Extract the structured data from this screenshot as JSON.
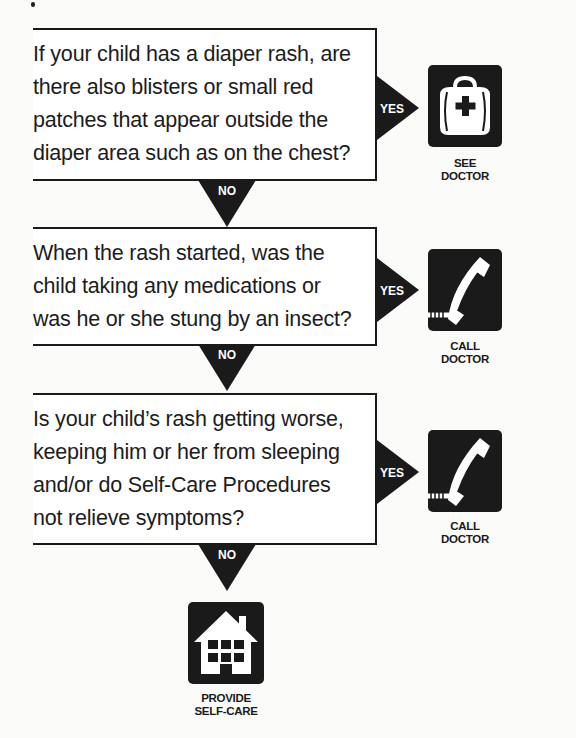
{
  "flowchart": {
    "title": "Diaper rash decision flowchart",
    "questions": [
      {
        "text": "If your child has a diaper rash, are\nthere also blisters or small red\npatches that appear outside the\ndiaper area such as on the chest?",
        "yes_label": "YES",
        "no_label": "NO",
        "outcome": {
          "icon": "medical-bag-icon",
          "label": "SEE\nDOCTOR"
        }
      },
      {
        "text": "When the rash started, was the\nchild taking any medications or\nwas he or she stung by an insect?",
        "yes_label": "YES",
        "no_label": "NO",
        "outcome": {
          "icon": "telephone-icon",
          "label": "CALL\nDOCTOR"
        }
      },
      {
        "text": "Is your child’s rash getting worse,\nkeeping him or her from sleeping\nand/or do Self-Care Procedures\nnot relieve symptoms?",
        "yes_label": "YES",
        "no_label": "NO",
        "outcome": {
          "icon": "telephone-icon",
          "label": "CALL\nDOCTOR"
        }
      }
    ],
    "final_outcome": {
      "icon": "house-icon",
      "label": "PROVIDE\nSELF-CARE"
    }
  },
  "colors": {
    "ink": "#1a1a1a",
    "paper": "#fbfbfa",
    "icon_fg": "#ffffff"
  }
}
